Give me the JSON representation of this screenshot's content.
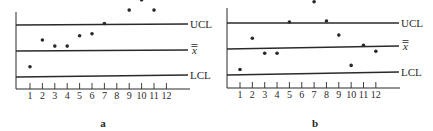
{
  "chart_data": [
    {
      "type": "scatter",
      "panel_label": "a",
      "title": "",
      "xlabel": "",
      "ylabel": "",
      "x": [
        1,
        2,
        3,
        4,
        5,
        6,
        7,
        8,
        9,
        10,
        11,
        12
      ],
      "tick_labels": [
        "1",
        "2",
        "3",
        "4",
        "5",
        "6",
        "7",
        "8",
        "9",
        "10",
        "11",
        "12"
      ],
      "control_lines": [
        {
          "name": "UCL",
          "label": "UCL",
          "value": 100
        },
        {
          "name": "mean",
          "label": "x̿",
          "value": 50
        },
        {
          "name": "LCL",
          "label": "LCL",
          "value": 0
        }
      ],
      "series": [
        {
          "name": "samples",
          "values": [
            18,
            70,
            58,
            58,
            78,
            82,
            102,
            156,
            128,
            148,
            128,
            182
          ]
        }
      ],
      "units_note": "Relative scale: LCL=0, center=50, UCL=100 (values estimated from pixel positions)",
      "grid": false,
      "legend": "none"
    },
    {
      "type": "scatter",
      "panel_label": "b",
      "title": "",
      "xlabel": "",
      "ylabel": "",
      "x": [
        1,
        2,
        3,
        4,
        5,
        6,
        7,
        8,
        9,
        10,
        11,
        12
      ],
      "tick_labels": [
        "1",
        "2",
        "3",
        "4",
        "5",
        "6",
        "7",
        "8",
        "9",
        "10",
        "11",
        "12"
      ],
      "control_lines": [
        {
          "name": "UCL",
          "label": "UCL",
          "value": 100
        },
        {
          "name": "mean",
          "label": "x̿",
          "value": 50
        },
        {
          "name": "LCL",
          "label": "LCL",
          "value": 0
        }
      ],
      "series": [
        {
          "name": "samples",
          "values": [
            8,
            70,
            40,
            40,
            102,
            162,
            142,
            104,
            76,
            16,
            56,
            44
          ]
        }
      ],
      "units_note": "Relative scale: LCL=0, center=50, UCL=100 (values estimated from pixel positions)",
      "grid": false,
      "legend": "none"
    }
  ],
  "panels": [
    {
      "id": "a",
      "caption": "a",
      "labels": {
        "ucl": "UCL",
        "mean_symbol": "x",
        "lcl": "LCL"
      },
      "ticks": [
        "1",
        "2",
        "3",
        "4",
        "5",
        "6",
        "7",
        "8",
        "9",
        "10",
        "11",
        "12"
      ]
    },
    {
      "id": "b",
      "caption": "b",
      "labels": {
        "ucl": "UCL",
        "mean_symbol": "x",
        "lcl": "LCL"
      },
      "ticks": [
        "1",
        "2",
        "3",
        "4",
        "5",
        "6",
        "7",
        "8",
        "9",
        "10",
        "11",
        "12"
      ]
    }
  ],
  "colors": {
    "ink": "#2a2a2a",
    "background": "#ffffff"
  }
}
